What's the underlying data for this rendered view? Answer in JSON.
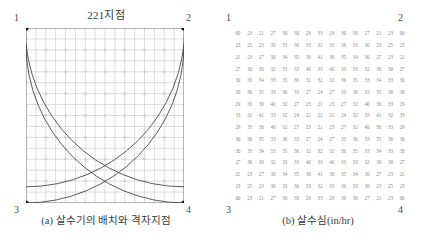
{
  "panel_a": {
    "title": "221지점",
    "caption": "(a) 살수기의 배치와 격자지점",
    "corner_labels": {
      "top_left": "1",
      "top_right": "2",
      "bottom_left": "3",
      "bottom_right": "4"
    },
    "grid_divisions": 16,
    "sprinkler_count": 4,
    "colors": {
      "grid_line": "#b9b9b9",
      "arc_line": "#4a4a4a",
      "sprinkler_dot": "#141414",
      "border": "#6f6f6f"
    }
  },
  "panel_b": {
    "caption": "(b) 살수심(in/hr)",
    "corner_labels": {
      "top_left": "1",
      "top_right": "2",
      "bottom_left": "3",
      "bottom_right": "4"
    },
    "colors": {
      "text": "#8d8d8d"
    },
    "chart_data": {
      "type": "heatmap",
      "title": "살수심(in/hr)",
      "xlabel": "",
      "ylabel": "",
      "rows": 15,
      "cols": 15,
      "values": [
        [
          "00",
          "23",
          "21",
          "27",
          "30",
          "30",
          "29",
          "33",
          "29",
          "30",
          "30",
          "27",
          "21",
          "23",
          "00"
        ],
        [
          "23",
          "25",
          "23",
          "30",
          "33",
          "36",
          "33",
          "32",
          "33",
          "36",
          "33",
          "30",
          "23",
          "25",
          "23"
        ],
        [
          "21",
          "23",
          "27",
          "30",
          "34",
          "35",
          "30",
          "41",
          "30",
          "35",
          "34",
          "30",
          "27",
          "23",
          "21"
        ],
        [
          "27",
          "30",
          "30",
          "32",
          "33",
          "33",
          "40",
          "33",
          "40",
          "33",
          "33",
          "32",
          "30",
          "30",
          "27"
        ],
        [
          "30",
          "33",
          "34",
          "33",
          "35",
          "36",
          "32",
          "32",
          "32",
          "36",
          "35",
          "33",
          "34",
          "33",
          "30"
        ],
        [
          "30",
          "36",
          "35",
          "33",
          "36",
          "33",
          "27",
          "24",
          "27",
          "33",
          "36",
          "33",
          "35",
          "36",
          "30"
        ],
        [
          "29",
          "33",
          "30",
          "40",
          "32",
          "27",
          "23",
          "21",
          "23",
          "27",
          "32",
          "40",
          "30",
          "33",
          "29"
        ],
        [
          "33",
          "32",
          "41",
          "33",
          "32",
          "24",
          "21",
          "22",
          "21",
          "24",
          "32",
          "33",
          "41",
          "32",
          "33"
        ],
        [
          "29",
          "33",
          "30",
          "40",
          "32",
          "27",
          "23",
          "21",
          "23",
          "27",
          "32",
          "40",
          "30",
          "33",
          "29"
        ],
        [
          "30",
          "36",
          "35",
          "33",
          "36",
          "33",
          "27",
          "24",
          "27",
          "33",
          "36",
          "33",
          "35",
          "36",
          "30"
        ],
        [
          "30",
          "33",
          "34",
          "33",
          "35",
          "36",
          "32",
          "32",
          "32",
          "36",
          "35",
          "33",
          "34",
          "33",
          "30"
        ],
        [
          "27",
          "30",
          "30",
          "32",
          "33",
          "33",
          "40",
          "33",
          "40",
          "33",
          "33",
          "32",
          "30",
          "30",
          "27"
        ],
        [
          "21",
          "23",
          "27",
          "30",
          "34",
          "35",
          "30",
          "41",
          "30",
          "35",
          "34",
          "30",
          "27",
          "23",
          "21"
        ],
        [
          "23",
          "25",
          "23",
          "30",
          "33",
          "36",
          "33",
          "32",
          "33",
          "36",
          "33",
          "30",
          "23",
          "25",
          "23"
        ],
        [
          "00",
          "23",
          "21",
          "27",
          "30",
          "30",
          "29",
          "33",
          "29",
          "30",
          "30",
          "27",
          "21",
          "23",
          "00"
        ]
      ]
    }
  }
}
